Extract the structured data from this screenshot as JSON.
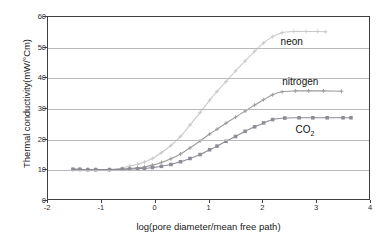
{
  "chart_data": {
    "type": "line",
    "title": "",
    "xlabel": "log(pore diameter/mean free path)",
    "ylabel": "Thermal conductivity(mW/°Cm)",
    "xlim": [
      -2,
      4
    ],
    "ylim": [
      0,
      60
    ],
    "xticks": [
      -2,
      -1,
      0,
      1,
      2,
      3,
      4
    ],
    "yticks": [
      0,
      10,
      20,
      30,
      40,
      50,
      60
    ],
    "xtick_labels": [
      "-2",
      "-1",
      "0",
      "1",
      "2",
      "3",
      "4"
    ],
    "ytick_labels": [
      "0",
      "10",
      "20",
      "30",
      "40",
      "50",
      "60"
    ],
    "grid": "horizontal",
    "legend": "inline-annotations",
    "series": [
      {
        "name": "neon",
        "color": "#c9c9c9",
        "marker": "plus",
        "label_x": 2.32,
        "label_y": 51.5,
        "x": [
          -1.55,
          -1.42,
          -1.27,
          -1.12,
          -0.86,
          -0.62,
          -0.48,
          -0.33,
          -0.2,
          -0.05,
          0.12,
          0.3,
          0.48,
          0.66,
          0.85,
          1.03,
          1.17,
          1.34,
          1.52,
          1.7,
          1.88,
          2.05,
          2.22,
          2.4,
          2.62,
          2.85,
          3.07,
          3.22
        ],
        "y": [
          9.5,
          9.5,
          9.4,
          9.4,
          9.4,
          9.9,
          10.6,
          11.2,
          11.9,
          13.1,
          15.0,
          17.4,
          20.4,
          24.2,
          28.3,
          32.4,
          35.3,
          38.6,
          42.1,
          45.4,
          48.6,
          51.4,
          53.5,
          54.8,
          55.2,
          55.2,
          55.2,
          55.1
        ]
      },
      {
        "name": "nitrogen",
        "color": "#9a9a9a",
        "marker": "plus",
        "label_x": 2.35,
        "label_y": 38.6,
        "x": [
          -1.55,
          -1.42,
          -1.27,
          -1.12,
          -0.86,
          -0.62,
          -0.48,
          -0.33,
          -0.2,
          -0.05,
          0.12,
          0.3,
          0.48,
          0.66,
          0.85,
          1.03,
          1.17,
          1.34,
          1.52,
          1.7,
          1.88,
          2.05,
          2.22,
          2.4,
          2.65,
          2.9,
          3.18,
          3.52
        ],
        "y": [
          9.5,
          9.5,
          9.4,
          9.4,
          9.4,
          9.6,
          9.8,
          10.0,
          10.3,
          10.9,
          11.8,
          13.0,
          14.6,
          16.6,
          18.9,
          21.2,
          22.8,
          24.8,
          26.8,
          28.8,
          30.8,
          32.6,
          34.2,
          35.2,
          35.5,
          35.5,
          35.5,
          35.4
        ]
      },
      {
        "name": "CO2",
        "display_name": "CO₂",
        "color": "#8c8c96",
        "marker": "square",
        "label_x": 2.6,
        "label_y": 23.0,
        "x": [
          -1.55,
          -1.42,
          -1.27,
          -1.12,
          -0.86,
          -0.62,
          -0.48,
          -0.33,
          -0.2,
          -0.05,
          0.12,
          0.3,
          0.48,
          0.66,
          0.85,
          1.03,
          1.17,
          1.34,
          1.52,
          1.7,
          1.88,
          2.05,
          2.22,
          2.45,
          2.72,
          2.98,
          3.25,
          3.55,
          3.7
        ],
        "y": [
          9.5,
          9.5,
          9.4,
          9.4,
          9.4,
          9.5,
          9.6,
          9.7,
          9.8,
          10.1,
          10.5,
          11.1,
          12.0,
          13.1,
          14.4,
          16.0,
          17.2,
          18.8,
          20.4,
          22.1,
          23.6,
          24.9,
          26.0,
          26.5,
          26.6,
          26.6,
          26.6,
          26.6,
          26.6
        ]
      }
    ]
  },
  "annotations": {
    "neon": "neon",
    "nitrogen": "nitrogen",
    "co2_main": "CO",
    "co2_sub": "2"
  },
  "colors": {
    "axis": "#3f3f3f",
    "grid": "#b9b9b9",
    "text": "#1a1a1a",
    "background": "#ffffff"
  }
}
